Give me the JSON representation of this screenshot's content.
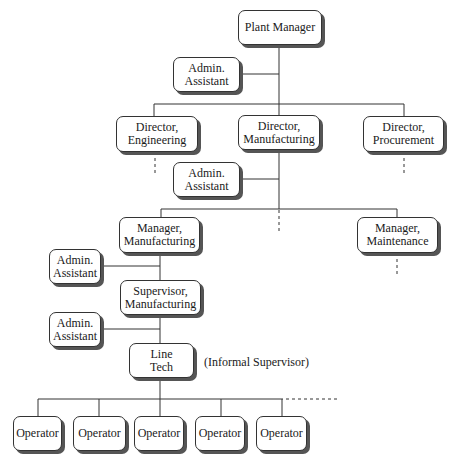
{
  "chart": {
    "nodes": {
      "plant_manager": {
        "line1": "Plant Manager",
        "line2": ""
      },
      "admin_1": {
        "line1": "Admin.",
        "line2": "Assistant"
      },
      "dir_engineering": {
        "line1": "Director,",
        "line2": "Engineering"
      },
      "dir_manufacturing": {
        "line1": "Director,",
        "line2": "Manufacturing"
      },
      "dir_procurement": {
        "line1": "Director,",
        "line2": "Procurement"
      },
      "admin_2": {
        "line1": "Admin.",
        "line2": "Assistant"
      },
      "mgr_manufacturing": {
        "line1": "Manager,",
        "line2": "Manufacturing"
      },
      "mgr_maintenance": {
        "line1": "Manager,",
        "line2": "Maintenance"
      },
      "admin_3": {
        "line1": "Admin.",
        "line2": "Assistant"
      },
      "sup_manufacturing": {
        "line1": "Supervisor,",
        "line2": "Manufacturing"
      },
      "admin_4": {
        "line1": "Admin.",
        "line2": "Assistant"
      },
      "line_tech": {
        "line1": "Line",
        "line2": "Tech"
      },
      "operators": [
        "Operator",
        "Operator",
        "Operator",
        "Operator",
        "Operator"
      ]
    },
    "annotation": "(Informal Supervisor)",
    "colors": {
      "line": "#333333",
      "shadow": "#555555",
      "box_fill": "#ffffff"
    }
  }
}
